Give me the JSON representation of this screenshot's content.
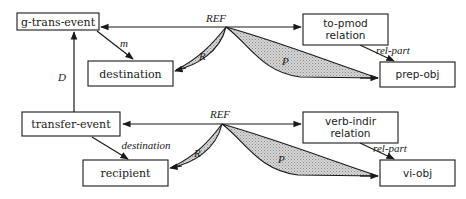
{
  "top": {
    "source_node": "g-trans-event",
    "target_node": "destination",
    "relation_node": [
      "to-pmod",
      "relation"
    ],
    "object_node": "prep-obj",
    "ref_label": "REF",
    "edge_m": "m",
    "edge_rel_part": "rel-part",
    "fan_r": "R",
    "fan_p": "P"
  },
  "link": {
    "edge_d": "D"
  },
  "bottom": {
    "source_node": "transfer-event",
    "target_node": "recipient",
    "relation_node": [
      "verb-indir",
      "relation"
    ],
    "object_node": "vi-obj",
    "ref_label": "REF",
    "edge_destination": "destination",
    "edge_rel_part": "rel-part",
    "fan_r": "R",
    "fan_p": "P"
  }
}
